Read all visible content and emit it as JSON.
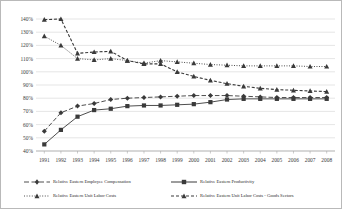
{
  "chart_data": {
    "type": "line",
    "title": "",
    "xlabel": "",
    "ylabel": "",
    "grid": true,
    "legend_position": "bottom",
    "ylim": [
      40,
      140
    ],
    "ytick_step": 10,
    "ytick_labels": [
      "140%",
      "130%",
      "120%",
      "110%",
      "100%",
      "90%",
      "80%",
      "70%",
      "60%",
      "50%",
      "40%"
    ],
    "categories": [
      "1991",
      "1992",
      "1993",
      "1994",
      "1995",
      "1996",
      "1997",
      "1998",
      "1999",
      "2000",
      "2001",
      "2002",
      "2003",
      "2004",
      "2005",
      "2006",
      "2007",
      "2008"
    ],
    "series": [
      {
        "name": "Relative Eastern Employee Compensation",
        "marker": "diamond",
        "line": "dash-long",
        "values": [
          55,
          69,
          74,
          76,
          79,
          80,
          80.5,
          81,
          81.5,
          82,
          82,
          82,
          81.5,
          81,
          80.5,
          80.5,
          80.5,
          80.5
        ]
      },
      {
        "name": "Relative Eastern Productivity",
        "marker": "square",
        "line": "solid",
        "values": [
          45,
          56,
          66,
          71,
          72,
          74,
          74.5,
          74.5,
          75,
          75.5,
          77,
          79,
          79.5,
          79.5,
          79.5,
          79.5,
          79.5,
          79.5
        ]
      },
      {
        "name": "Relative Eastern Unit Labor Costs",
        "marker": "triangle",
        "line": "dotted",
        "values": [
          127,
          120,
          110,
          109,
          110,
          108.5,
          106.5,
          108.5,
          107.5,
          106.5,
          105.5,
          105,
          104.5,
          104.5,
          104.5,
          104.5,
          104,
          104
        ]
      },
      {
        "name": "Relative Eastern Unit Labor Costs - Goods Sectors",
        "marker": "triangle",
        "line": "dash-short",
        "values": [
          139.5,
          140,
          114,
          115,
          115.5,
          108.5,
          106,
          106,
          100,
          96.5,
          93.5,
          91,
          89,
          87.5,
          86.5,
          86,
          85.5,
          85
        ]
      }
    ]
  },
  "legend": {
    "items": [
      {
        "label": "Relative Eastern Employee Compensation"
      },
      {
        "label": "Relative Eastern Productivity"
      },
      {
        "label": "Relative Eastern Unit Labor Costs"
      },
      {
        "label": "Relative Eastern Unit Labor Costs - Goods Sectors"
      }
    ]
  },
  "colors": {
    "series_ink": "#3a3a3a",
    "grid": "#d3d3d3",
    "border": "#b9b9b9",
    "text": "#2b2b2b"
  }
}
